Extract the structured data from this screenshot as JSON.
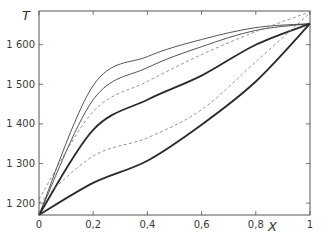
{
  "chart_data": {
    "type": "line",
    "title": "",
    "xlabel": "X",
    "ylabel": "T",
    "xlim": [
      0,
      1
    ],
    "ylim": [
      1170,
      1685
    ],
    "grid": false,
    "legend": "none",
    "x_ticks": [
      {
        "value": 0,
        "label": "0"
      },
      {
        "value": 0.2,
        "label": "0,2"
      },
      {
        "value": 0.4,
        "label": "0,4"
      },
      {
        "value": 0.6,
        "label": "0,6"
      },
      {
        "value": 0.8,
        "label": "0,8"
      },
      {
        "value": 1,
        "label": "1"
      }
    ],
    "y_ticks": [
      {
        "value": 1200,
        "label": "1 200"
      },
      {
        "value": 1300,
        "label": "1 300"
      },
      {
        "value": 1400,
        "label": "1 400"
      },
      {
        "value": 1500,
        "label": "1 500"
      },
      {
        "value": 1600,
        "label": "1 600"
      }
    ],
    "x": [
      0,
      0.2,
      0.4,
      0.6,
      0.8,
      1
    ],
    "series": [
      {
        "name": "thin-upper-1",
        "style": "solid",
        "width": 0.8,
        "values": [
          1170,
          1497,
          1570,
          1613,
          1643,
          1653
        ]
      },
      {
        "name": "thin-upper-2",
        "style": "solid",
        "width": 0.8,
        "values": [
          1170,
          1461,
          1542,
          1595,
          1636,
          1653
        ]
      },
      {
        "name": "dashed-upper",
        "style": "dashed",
        "width": 0.8,
        "values": [
          1210,
          1431,
          1507,
          1575,
          1633,
          1683
        ]
      },
      {
        "name": "thick-middle",
        "style": "solid",
        "width": 1.8,
        "values": [
          1170,
          1385,
          1461,
          1522,
          1600,
          1653
        ]
      },
      {
        "name": "dashed-lower",
        "style": "dashed",
        "width": 0.8,
        "values": [
          1200,
          1319,
          1365,
          1436,
          1557,
          1680
        ]
      },
      {
        "name": "thick-lower",
        "style": "solid",
        "width": 1.8,
        "values": [
          1170,
          1251,
          1307,
          1398,
          1507,
          1653
        ]
      }
    ]
  },
  "axes": {
    "x_label": "X",
    "y_label": "T"
  },
  "colors": {
    "line": "#2a2a2a",
    "dashed": "#777777",
    "frame": "#555555",
    "text": "#3a3a3a"
  }
}
